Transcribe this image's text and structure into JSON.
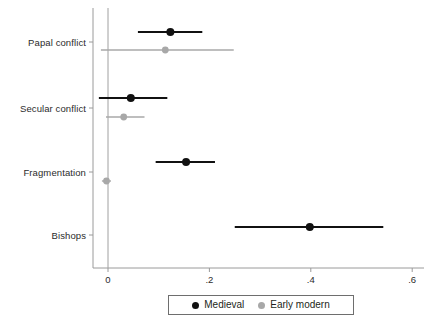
{
  "chart_data": {
    "type": "scatter",
    "title": "",
    "xlabel": "",
    "ylabel": "",
    "orientation": "horizontal",
    "plot_style": "coefficient plot with confidence interval whiskers",
    "grid": false,
    "zero_reference_line": 0,
    "xlim": [
      -0.035,
      0.625
    ],
    "xticks": [
      0,
      0.2,
      0.4,
      0.6
    ],
    "xtick_labels": [
      "0",
      ".2",
      ".4",
      ".6"
    ],
    "categories": [
      "Papal conflict",
      "Secular conflict",
      "Fragmentation",
      "Bishops"
    ],
    "legend": {
      "position": "bottom-center",
      "entries": [
        {
          "name": "Medieval",
          "color": "#111111"
        },
        {
          "name": "Early modern",
          "color": "#a8a8a8"
        }
      ]
    },
    "series": [
      {
        "name": "Medieval",
        "color": "#111111",
        "points": [
          {
            "category": "Papal conflict",
            "estimate": 0.123,
            "ci_low": 0.059,
            "ci_high": 0.186
          },
          {
            "category": "Secular conflict",
            "estimate": 0.045,
            "ci_low": -0.018,
            "ci_high": 0.117
          },
          {
            "category": "Fragmentation",
            "estimate": 0.154,
            "ci_low": 0.094,
            "ci_high": 0.211
          },
          {
            "category": "Bishops",
            "estimate": 0.398,
            "ci_low": 0.25,
            "ci_high": 0.543
          }
        ]
      },
      {
        "name": "Early modern",
        "color": "#a8a8a8",
        "points": [
          {
            "category": "Papal conflict",
            "estimate": 0.113,
            "ci_low": -0.014,
            "ci_high": 0.248
          },
          {
            "category": "Secular conflict",
            "estimate": 0.031,
            "ci_low": -0.004,
            "ci_high": 0.072
          },
          {
            "category": "Fragmentation",
            "estimate": -0.003,
            "ci_low": -0.012,
            "ci_high": 0.006
          }
        ]
      }
    ]
  },
  "layout": {
    "axis_color": "#9a9a9a",
    "zero_line_color": "#a0a0a0",
    "plot_left": 108,
    "plot_right": 412,
    "px_per_unit": 507,
    "baseline_y": 268,
    "row_positions": {
      "Papal conflict": {
        "label_y": 42,
        "medieval_y": 32,
        "early_modern_y": 50
      },
      "Secular conflict": {
        "label_y": 108,
        "medieval_y": 98,
        "early_modern_y": 117
      },
      "Fragmentation": {
        "label_y": 172,
        "medieval_y": 162,
        "early_modern_y": 181
      },
      "Bishops": {
        "label_y": 235,
        "medieval_y": 227,
        "early_modern_y": null
      }
    }
  }
}
